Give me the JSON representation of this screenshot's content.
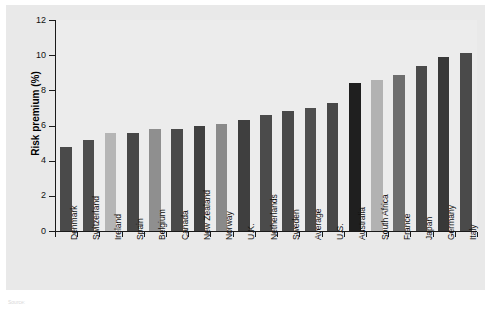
{
  "chart_data": {
    "type": "bar",
    "title": "",
    "xlabel": "",
    "ylabel": "Risk premium (%)",
    "ylim": [
      0,
      12
    ],
    "yticks": [
      0,
      2,
      4,
      6,
      8,
      10,
      12
    ],
    "ytick_labels": [
      "0",
      "2",
      "4",
      "6",
      "8",
      "10",
      "12"
    ],
    "grid": false,
    "legend": "none",
    "categories": [
      "Denmark",
      "Switzerland",
      "Ireland",
      "Spain",
      "Belgium",
      "Canada",
      "New Zealand",
      "Norway",
      "U.K.",
      "Netherlands",
      "Sweden",
      "Average",
      "U.S.",
      "Australia",
      "South Africa",
      "France",
      "Japan",
      "Germany",
      "Italy"
    ],
    "values": [
      4.8,
      5.2,
      5.6,
      5.6,
      5.8,
      5.8,
      6.0,
      6.1,
      6.3,
      6.6,
      6.8,
      7.0,
      7.3,
      8.4,
      8.6,
      8.9,
      9.4,
      9.9,
      10.1
    ],
    "bar_colors": [
      "#4a4a4a",
      "#4d4d4d",
      "#b5b5b5",
      "#474747",
      "#8f8f8f",
      "#4a4a4a",
      "#404040",
      "#8a8a8a",
      "#3f3f3f",
      "#4b4b4b",
      "#494949",
      "#4e4e4e",
      "#474747",
      "#1f1f1f",
      "#b2b2b2",
      "#6e6e6e",
      "#4a4a4a",
      "#383838",
      "#4a4a4a"
    ]
  },
  "footnote": {
    "text": "Source:"
  }
}
